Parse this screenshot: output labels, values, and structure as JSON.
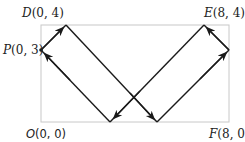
{
  "diagram": {
    "type": "billiard-path-in-rectangle",
    "colors": {
      "frame": "#c8c8c8",
      "path": "#1a1a1a",
      "text": "#222222",
      "background": "#ffffff"
    },
    "points": {
      "D": {
        "name": "D",
        "coords": "(0, 4)"
      },
      "P": {
        "name": "P",
        "coords": "(0, 3)"
      },
      "E": {
        "name": "E",
        "coords": "(8, 4)"
      },
      "O": {
        "name": "O",
        "coords": "(0, 0)"
      },
      "F": {
        "name": "F",
        "coords": "(8, 0)"
      }
    },
    "path_sequence": [
      "P(0,3)",
      "(1,4)",
      "(5,0)",
      "(8,3)",
      "(7,4)",
      "(3,0)",
      "P(0,3)"
    ]
  }
}
